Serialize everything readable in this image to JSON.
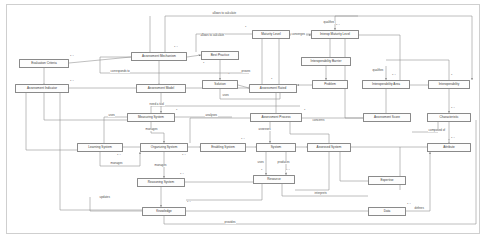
{
  "diagram": {
    "type": "uml-class-diagram",
    "width": 486,
    "height": 238,
    "line_color": "#8a8a8a",
    "node_fill": "#fdfdfd",
    "text_color": "#3a3a3a"
  },
  "nodes": [
    {
      "id": "evaluation-criteria",
      "label": "Evaluation Criteria",
      "x": 19,
      "y": 59,
      "w": 50,
      "h": 9
    },
    {
      "id": "assessment-indicator",
      "label": "Assessment Indicator",
      "x": 15,
      "y": 84,
      "w": 54,
      "h": 9
    },
    {
      "id": "assessment-mechanism",
      "label": "Assessment Mechanism",
      "x": 131,
      "y": 52,
      "w": 56,
      "h": 9
    },
    {
      "id": "assessment-model",
      "label": "Assessment Model",
      "x": 136,
      "y": 84,
      "w": 50,
      "h": 9
    },
    {
      "id": "best-practice",
      "label": "Best Practice",
      "x": 201,
      "y": 51,
      "w": 38,
      "h": 9
    },
    {
      "id": "solution",
      "label": "Solution",
      "x": 202,
      "y": 80,
      "w": 36,
      "h": 9
    },
    {
      "id": "maturity-level",
      "label": "Maturity Level",
      "x": 252,
      "y": 30,
      "w": 38,
      "h": 9
    },
    {
      "id": "interop-maturity-level",
      "label": "Interop Maturity Level",
      "x": 311,
      "y": 30,
      "w": 48,
      "h": 9
    },
    {
      "id": "interoperability-barrier",
      "label": "Interoperability Barrier",
      "x": 301,
      "y": 57,
      "w": 50,
      "h": 9
    },
    {
      "id": "assessment-rated",
      "label": "Assessment Rated",
      "x": 249,
      "y": 84,
      "w": 48,
      "h": 9
    },
    {
      "id": "problem",
      "label": "Problem",
      "x": 312,
      "y": 80,
      "w": 36,
      "h": 9
    },
    {
      "id": "interoperability-area",
      "label": "Interoperability Area",
      "x": 362,
      "y": 80,
      "w": 48,
      "h": 9
    },
    {
      "id": "interoperability",
      "label": "Interoperability",
      "x": 428,
      "y": 80,
      "w": 42,
      "h": 9
    },
    {
      "id": "measuring-system",
      "label": "Measuring System",
      "x": 127,
      "y": 113,
      "w": 48,
      "h": 9
    },
    {
      "id": "assessment-process",
      "label": "Assessment Process",
      "x": 250,
      "y": 113,
      "w": 52,
      "h": 9
    },
    {
      "id": "assessment-score",
      "label": "Assessment Score",
      "x": 363,
      "y": 113,
      "w": 48,
      "h": 9
    },
    {
      "id": "characteristic",
      "label": "Characteristic",
      "x": 427,
      "y": 113,
      "w": 44,
      "h": 9
    },
    {
      "id": "learning-system",
      "label": "Learning System",
      "x": 77,
      "y": 143,
      "w": 46,
      "h": 9
    },
    {
      "id": "organizing-system",
      "label": "Organizing System",
      "x": 140,
      "y": 143,
      "w": 48,
      "h": 9
    },
    {
      "id": "enabling-system",
      "label": "Enabling System",
      "x": 200,
      "y": 143,
      "w": 46,
      "h": 9
    },
    {
      "id": "system",
      "label": "System",
      "x": 256,
      "y": 143,
      "w": 40,
      "h": 9
    },
    {
      "id": "assessed-system",
      "label": "Assessed System",
      "x": 307,
      "y": 143,
      "w": 44,
      "h": 9
    },
    {
      "id": "attribute",
      "label": "Attribute",
      "x": 427,
      "y": 143,
      "w": 44,
      "h": 9
    },
    {
      "id": "reasoning-system",
      "label": "Reasoning System",
      "x": 137,
      "y": 178,
      "w": 48,
      "h": 9
    },
    {
      "id": "resource",
      "label": "Resource",
      "x": 253,
      "y": 175,
      "w": 42,
      "h": 9
    },
    {
      "id": "expertise",
      "label": "Expertise",
      "x": 368,
      "y": 176,
      "w": 38,
      "h": 9
    },
    {
      "id": "knowledge",
      "label": "Knowledge",
      "x": 142,
      "y": 207,
      "w": 44,
      "h": 9
    },
    {
      "id": "data",
      "label": "Data",
      "x": 368,
      "y": 207,
      "w": 38,
      "h": 9
    }
  ],
  "edge_labels": [
    {
      "id": "allows-to-calculate-top",
      "text": "allows to calculate",
      "x": 212,
      "y": 12
    },
    {
      "id": "allows-to-calculate-mid",
      "text": "allows to calculate",
      "x": 200,
      "y": 34
    },
    {
      "id": "qualifies-top",
      "text": "qualifies",
      "x": 323,
      "y": 21
    },
    {
      "id": "corresponds-to",
      "text": "corresponds to",
      "x": 110,
      "y": 73
    },
    {
      "id": "converges",
      "text": "converges",
      "x": 293,
      "y": 33
    },
    {
      "id": "proves",
      "text": "proves",
      "x": 243,
      "y": 72
    },
    {
      "id": "uses-solution",
      "text": "uses",
      "x": 226,
      "y": 94
    },
    {
      "id": "qualifies-area",
      "text": "qualifies",
      "x": 374,
      "y": 70
    },
    {
      "id": "need-a-tool",
      "text": "need a tool",
      "x": 151,
      "y": 106
    },
    {
      "id": "uses-measuring",
      "text": "uses",
      "x": 108,
      "y": 113
    },
    {
      "id": "analyses",
      "text": "analyses",
      "x": 228,
      "y": 127
    },
    {
      "id": "concerns",
      "text": "concerns",
      "x": 316,
      "y": 119
    },
    {
      "id": "assesses",
      "text": "assesses",
      "x": 262,
      "y": 129
    },
    {
      "id": "manages-organizing",
      "text": "manages",
      "x": 147,
      "y": 129
    },
    {
      "id": "manages-learning",
      "text": "manages",
      "x": 113,
      "y": 163
    },
    {
      "id": "manages-reasoning",
      "text": "manages",
      "x": 156,
      "y": 166
    },
    {
      "id": "uses-system",
      "text": "uses",
      "x": 260,
      "y": 162
    },
    {
      "id": "produces",
      "text": "produces",
      "x": 281,
      "y": 162
    },
    {
      "id": "composed-of",
      "text": "composed of",
      "x": 430,
      "y": 130
    },
    {
      "id": "interprets",
      "text": "interprets",
      "x": 318,
      "y": 196
    },
    {
      "id": "updates",
      "text": "updates",
      "x": 103,
      "y": 197
    },
    {
      "id": "defines",
      "text": "defines",
      "x": 419,
      "y": 208
    },
    {
      "id": "provides-bottom",
      "text": "provides",
      "x": 230,
      "y": 224
    }
  ],
  "multiplicities": [
    {
      "id": "m-ec-r",
      "text": "1..*",
      "x": 70,
      "y": 56
    },
    {
      "id": "m-ai-r",
      "text": "1..*",
      "x": 70,
      "y": 81
    },
    {
      "id": "m-am-t",
      "text": "1..*",
      "x": 176,
      "y": 47
    },
    {
      "id": "m-bp-b",
      "text": "1",
      "x": 204,
      "y": 63
    },
    {
      "id": "m-sol-t",
      "text": "1",
      "x": 229,
      "y": 74
    },
    {
      "id": "m-ml-l",
      "text": "1",
      "x": 246,
      "y": 27
    },
    {
      "id": "m-iml-t",
      "text": "1..*",
      "x": 337,
      "y": 24
    },
    {
      "id": "m-ar-t",
      "text": "1",
      "x": 272,
      "y": 79
    },
    {
      "id": "m-ia-t",
      "text": "1..*",
      "x": 393,
      "y": 75
    },
    {
      "id": "m-int-t",
      "text": "1",
      "x": 452,
      "y": 75
    },
    {
      "id": "m-ms-r",
      "text": "1",
      "x": 177,
      "y": 110
    },
    {
      "id": "m-ap-r",
      "text": "1",
      "x": 305,
      "y": 110
    },
    {
      "id": "m-ch-t",
      "text": "1..*",
      "x": 452,
      "y": 108
    },
    {
      "id": "m-attr-t",
      "text": "1..*",
      "x": 452,
      "y": 138
    },
    {
      "id": "m-ls-b",
      "text": "1..*",
      "x": 118,
      "y": 155
    },
    {
      "id": "m-os-b",
      "text": "1..*",
      "x": 183,
      "y": 155
    },
    {
      "id": "m-es-t",
      "text": "1..*",
      "x": 242,
      "y": 139
    },
    {
      "id": "m-sys-b",
      "text": "1",
      "x": 262,
      "y": 170
    },
    {
      "id": "m-res-b",
      "text": "1..*",
      "x": 287,
      "y": 170
    },
    {
      "id": "m-rs-t",
      "text": "1..*",
      "x": 181,
      "y": 174
    },
    {
      "id": "m-kn-t",
      "text": "1..*",
      "x": 188,
      "y": 202
    },
    {
      "id": "m-data-r",
      "text": "1..*",
      "x": 408,
      "y": 204
    }
  ]
}
